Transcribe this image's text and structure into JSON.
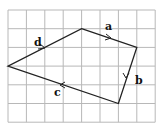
{
  "diagram": {
    "grid": {
      "cols": 8,
      "rows": 6,
      "x0": 8,
      "y0": 10,
      "cw": 18.4,
      "ch": 18.7,
      "color": "#b0b0b0"
    },
    "vertices": [
      [
        4,
        1
      ],
      [
        7,
        2
      ],
      [
        6,
        5
      ],
      [
        0,
        3
      ]
    ],
    "edges": [
      {
        "label": "a",
        "from": 0,
        "to": 1
      },
      {
        "label": "b",
        "from": 1,
        "to": 2
      },
      {
        "label": "c",
        "from": 2,
        "to": 3
      },
      {
        "label": "d",
        "from": 3,
        "to": 0
      }
    ],
    "line_color": "#222222"
  }
}
